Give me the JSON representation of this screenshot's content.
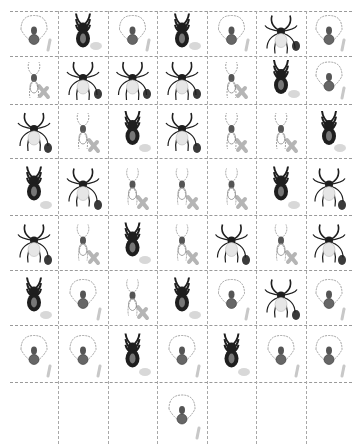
{
  "title": {
    "text": "",
    "clipped": true
  },
  "grid": {
    "columns": 7,
    "rows": 8,
    "col_x": [
      0,
      48,
      98,
      147,
      197,
      246,
      296,
      342
    ],
    "row_y": [
      0,
      45,
      93,
      147,
      204,
      259,
      314,
      371,
      433
    ]
  },
  "legend_types": {
    "pale": "pale orb-weaver spider (light outline)",
    "jump": "dark stout spider",
    "long": "dark long-legged spider",
    "palelong": "pale long-legged spider"
  },
  "marks": {
    "stroke": "light gray stroke",
    "blob": "light gray blob",
    "oval": "dark oval",
    "x": "gray cross",
    "none": "no mark"
  },
  "colors": {
    "line": "#9a9a9a",
    "dark": "#1e1e1e",
    "pale": "#8a8a8a",
    "mark_gray": "#c8c8c8",
    "oval": "#3a3a3a"
  },
  "cells": [
    [
      {
        "type": "pale",
        "mark": "stroke"
      },
      {
        "type": "jump",
        "mark": "blob"
      },
      {
        "type": "pale",
        "mark": "stroke"
      },
      {
        "type": "jump",
        "mark": "blob"
      },
      {
        "type": "pale",
        "mark": "stroke"
      },
      {
        "type": "long",
        "mark": "oval"
      },
      {
        "type": "pale",
        "mark": "stroke"
      }
    ],
    [
      {
        "type": "palelong",
        "mark": "x"
      },
      {
        "type": "long",
        "mark": "oval"
      },
      {
        "type": "long",
        "mark": "oval"
      },
      {
        "type": "long",
        "mark": "oval"
      },
      {
        "type": "palelong",
        "mark": "x"
      },
      {
        "type": "jump",
        "mark": "blob"
      },
      {
        "type": "pale",
        "mark": "stroke"
      }
    ],
    [
      {
        "type": "long",
        "mark": "oval"
      },
      {
        "type": "palelong",
        "mark": "x"
      },
      {
        "type": "jump",
        "mark": "blob"
      },
      {
        "type": "long",
        "mark": "oval"
      },
      {
        "type": "palelong",
        "mark": "x"
      },
      {
        "type": "palelong",
        "mark": "x"
      },
      {
        "type": "jump",
        "mark": "blob"
      }
    ],
    [
      {
        "type": "jump",
        "mark": "blob"
      },
      {
        "type": "long",
        "mark": "oval"
      },
      {
        "type": "palelong",
        "mark": "x"
      },
      {
        "type": "palelong",
        "mark": "x"
      },
      {
        "type": "palelong",
        "mark": "x"
      },
      {
        "type": "jump",
        "mark": "blob"
      },
      {
        "type": "long",
        "mark": "oval"
      }
    ],
    [
      {
        "type": "long",
        "mark": "oval"
      },
      {
        "type": "palelong",
        "mark": "x"
      },
      {
        "type": "jump",
        "mark": "blob"
      },
      {
        "type": "palelong",
        "mark": "x"
      },
      {
        "type": "long",
        "mark": "oval"
      },
      {
        "type": "palelong",
        "mark": "x"
      },
      {
        "type": "long",
        "mark": "oval"
      }
    ],
    [
      {
        "type": "jump",
        "mark": "blob"
      },
      {
        "type": "pale",
        "mark": "stroke"
      },
      {
        "type": "palelong",
        "mark": "x"
      },
      {
        "type": "jump",
        "mark": "blob"
      },
      {
        "type": "pale",
        "mark": "stroke"
      },
      {
        "type": "long",
        "mark": "oval"
      },
      {
        "type": "pale",
        "mark": "stroke"
      }
    ],
    [
      {
        "type": "pale",
        "mark": "stroke"
      },
      {
        "type": "pale",
        "mark": "stroke"
      },
      {
        "type": "jump",
        "mark": "blob"
      },
      {
        "type": "pale",
        "mark": "stroke"
      },
      {
        "type": "jump",
        "mark": "blob"
      },
      {
        "type": "pale",
        "mark": "stroke"
      },
      {
        "type": "pale",
        "mark": "stroke"
      }
    ],
    [
      {
        "type": "none",
        "mark": "none"
      },
      {
        "type": "none",
        "mark": "none"
      },
      {
        "type": "none",
        "mark": "none"
      },
      {
        "type": "pale",
        "mark": "stroke"
      },
      {
        "type": "none",
        "mark": "none"
      },
      {
        "type": "none",
        "mark": "none"
      },
      {
        "type": "none",
        "mark": "none"
      }
    ]
  ]
}
